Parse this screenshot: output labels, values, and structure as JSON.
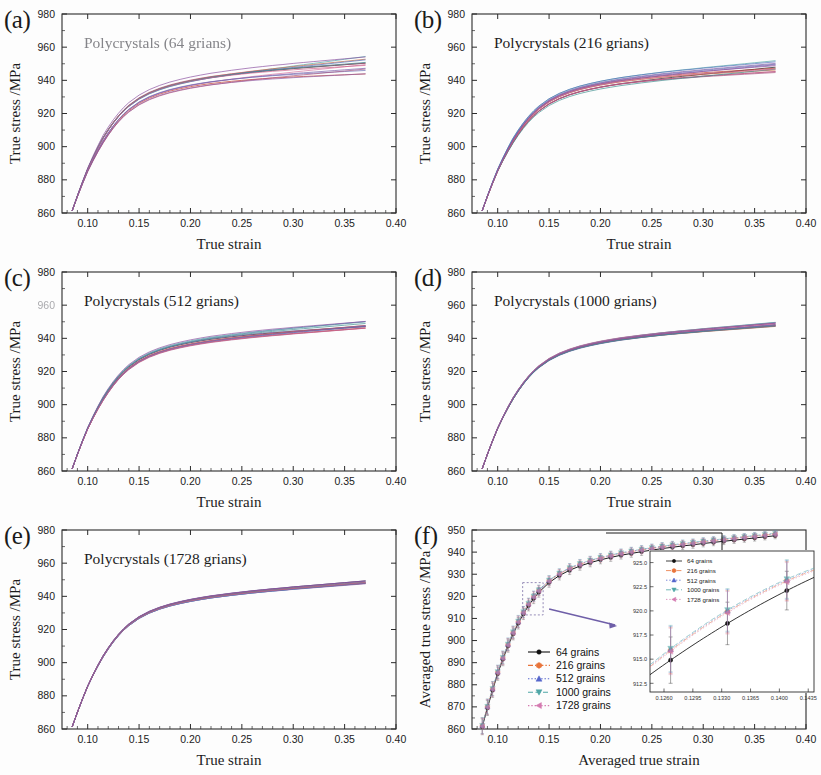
{
  "figure": {
    "background": "#fdfdfd",
    "width": 821,
    "height": 775
  },
  "panels": [
    {
      "id": "a",
      "label": "(a)",
      "title": "Polycrystals (64 grians)",
      "title_degraded": true,
      "xlabel": "True strain",
      "ylabel": "True stress /MPa",
      "xticks": [
        "0.10",
        "0.15",
        "0.20",
        "0.25",
        "0.30",
        "0.35",
        "0.40"
      ],
      "yticks": [
        "860",
        "880",
        "900",
        "920",
        "940",
        "960",
        "980"
      ],
      "xlim": [
        0.075,
        0.4
      ],
      "ylim": [
        860,
        980
      ],
      "spread": 5.2,
      "n_curves": 14
    },
    {
      "id": "b",
      "label": "(b)",
      "title": "Polycrystals (216 grians)",
      "title_degraded": false,
      "xlabel": "True strain",
      "ylabel": "True stress /MPa",
      "xticks": [
        "0.10",
        "0.15",
        "0.20",
        "0.25",
        "0.30",
        "0.35",
        "0.40"
      ],
      "yticks": [
        "860",
        "880",
        "900",
        "920",
        "940",
        "960",
        "980"
      ],
      "xlim": [
        0.075,
        0.4
      ],
      "ylim": [
        860,
        980
      ],
      "spread": 3.4,
      "n_curves": 14
    },
    {
      "id": "c",
      "label": "(c)",
      "title": "Polycrystals (512 grians)",
      "title_degraded": false,
      "xlabel": "True strain",
      "ylabel": "True stress /MPa",
      "xticks": [
        "0.10",
        "0.15",
        "0.20",
        "0.25",
        "0.30",
        "0.35",
        "0.40"
      ],
      "yticks": [
        "860",
        "880",
        "900",
        "920",
        "940",
        "960",
        "980"
      ],
      "xlim": [
        0.075,
        0.4
      ],
      "ylim": [
        860,
        980
      ],
      "spread": 2.1,
      "n_curves": 14
    },
    {
      "id": "d",
      "label": "(d)",
      "title": "Polycrystals (1000 grians)",
      "title_degraded": false,
      "xlabel": "True strain",
      "ylabel": "True stress /MPa",
      "xticks": [
        "0.10",
        "0.15",
        "0.20",
        "0.25",
        "0.30",
        "0.35",
        "0.40"
      ],
      "yticks": [
        "860",
        "880",
        "900",
        "920",
        "940",
        "960",
        "980"
      ],
      "xlim": [
        0.075,
        0.4
      ],
      "ylim": [
        860,
        980
      ],
      "spread": 1.3,
      "n_curves": 14
    },
    {
      "id": "e",
      "label": "(e)",
      "title": "Polycrystals (1728 grians)",
      "title_degraded": false,
      "xlabel": "True strain",
      "ylabel": "True stress /MPa",
      "xticks": [
        "0.10",
        "0.15",
        "0.20",
        "0.25",
        "0.30",
        "0.35",
        "0.40"
      ],
      "yticks": [
        "860",
        "880",
        "900",
        "920",
        "940",
        "960",
        "980"
      ],
      "xlim": [
        0.075,
        0.4
      ],
      "ylim": [
        860,
        980
      ],
      "spread": 0.9,
      "n_curves": 14
    },
    {
      "id": "f",
      "label": "(f)",
      "title": "",
      "title_degraded": false,
      "xlabel": "Averaged true strain",
      "ylabel": "Averaged true stress /MPa",
      "xticks": [
        "0.10",
        "0.15",
        "0.20",
        "0.25",
        "0.30",
        "0.35",
        "0.40"
      ],
      "yticks": [
        "860",
        "870",
        "880",
        "890",
        "900",
        "910",
        "920",
        "930",
        "940",
        "950"
      ],
      "xlim": [
        0.075,
        0.4
      ],
      "ylim": [
        860,
        950
      ]
    }
  ],
  "legend": {
    "entries": [
      {
        "label": "64 grains",
        "color": "#111111",
        "marker": "circle",
        "line": "solid"
      },
      {
        "label": "216 grains",
        "color": "#e8743b",
        "marker": "hexagon",
        "line": "dashdot"
      },
      {
        "label": "512 grains",
        "color": "#5566cc",
        "marker": "triangle-up",
        "line": "dotted"
      },
      {
        "label": "1000 grains",
        "color": "#4fa6a6",
        "marker": "triangle-down",
        "line": "dashed"
      },
      {
        "label": "1728 grains",
        "color": "#d47ab0",
        "marker": "triangle-left",
        "line": "dotted"
      }
    ]
  },
  "inset": {
    "xticks": [
      "0.1260",
      "0.1295",
      "0.1330",
      "0.1365",
      "0.1400",
      "0.1435"
    ],
    "yticks": [
      "912.5",
      "915.0",
      "917.5",
      "920.0",
      "922.5",
      "925.0"
    ],
    "xlim": [
      0.1243,
      0.1442
    ],
    "ylim": [
      911.6,
      926.2
    ],
    "legend_entries": [
      {
        "label": "64 grains",
        "color": "#111111",
        "marker": "circle",
        "line": "solid"
      },
      {
        "label": "216 grains",
        "color": "#e8743b",
        "marker": "hexagon",
        "line": "dashdot"
      },
      {
        "label": "512 grains",
        "color": "#5566cc",
        "marker": "triangle-up",
        "line": "dotted"
      },
      {
        "label": "1000 grains",
        "color": "#4fa6a6",
        "marker": "triangle-down",
        "line": "dashed"
      },
      {
        "label": "1728 grains",
        "color": "#d47ab0",
        "marker": "triangle-left",
        "line": "dotted"
      }
    ],
    "data_points": [
      {
        "x": 0.1268,
        "y_64": 914.9,
        "y_216": 915.9,
        "y_512": 916.0,
        "y_1000": 916.1,
        "y_1728": 915.8,
        "err": 2.4
      },
      {
        "x": 0.1337,
        "y_64": 918.7,
        "y_216": 919.9,
        "y_512": 920.0,
        "y_1000": 920.1,
        "y_1728": 919.8,
        "err": 2.2
      },
      {
        "x": 0.1409,
        "y_64": 922.1,
        "y_216": 923.1,
        "y_512": 923.2,
        "y_1000": 923.3,
        "y_1728": 923.0,
        "err": 2.0
      }
    ]
  },
  "annotation": {
    "zoom_box_color": "#8a7fb0",
    "arrow_color": "#6f5fa8",
    "bracket_color": "#1a1a1a"
  },
  "chart_data": {
    "type": "line",
    "xlabel": "True strain",
    "ylabel": "True stress /MPa",
    "xlim": [
      0.075,
      0.4
    ],
    "ylim": [
      860,
      980
    ],
    "grid": false,
    "legend_position": "center-left (panel f)",
    "note": "Panels (a)-(e) each show ~14 overlapping stress-strain curves for random grain orientation sets; scatter narrows as grain count increases. Panel (f) overlays the averaged curves with standard-deviation error bars for all five grain counts, with an inset magnifying strain 0.126-0.144.",
    "x": [
      0.085,
      0.09,
      0.095,
      0.1,
      0.105,
      0.11,
      0.115,
      0.12,
      0.125,
      0.13,
      0.135,
      0.14,
      0.15,
      0.16,
      0.17,
      0.18,
      0.19,
      0.2,
      0.21,
      0.22,
      0.23,
      0.24,
      0.25,
      0.26,
      0.27,
      0.28,
      0.29,
      0.3,
      0.31,
      0.32,
      0.33,
      0.34,
      0.35,
      0.36,
      0.37
    ],
    "series": [
      {
        "name": "64 grains",
        "color": "#111111",
        "values": [
          861.0,
          869.5,
          877.5,
          885.0,
          891.5,
          897.5,
          903.0,
          907.8,
          912.0,
          915.8,
          919.0,
          921.8,
          926.2,
          929.4,
          931.8,
          933.7,
          935.2,
          936.5,
          937.6,
          938.6,
          939.4,
          940.2,
          940.9,
          941.6,
          942.2,
          942.8,
          943.3,
          943.9,
          944.4,
          944.9,
          945.4,
          945.9,
          946.4,
          946.9,
          947.4
        ]
      },
      {
        "name": "216 grains",
        "color": "#e8743b",
        "values": [
          861.4,
          870.0,
          878.1,
          885.6,
          892.1,
          898.1,
          903.6,
          908.5,
          912.7,
          916.5,
          919.8,
          922.6,
          927.0,
          930.2,
          932.6,
          934.5,
          936.0,
          937.3,
          938.4,
          939.4,
          940.2,
          941.0,
          941.7,
          942.4,
          943.0,
          943.6,
          944.1,
          944.7,
          945.2,
          945.7,
          946.2,
          946.7,
          947.2,
          947.7,
          948.2
        ]
      },
      {
        "name": "512 grains",
        "color": "#5566cc",
        "values": [
          861.5,
          870.1,
          878.2,
          885.8,
          892.3,
          898.3,
          903.8,
          908.6,
          912.9,
          916.7,
          920.0,
          922.8,
          927.2,
          930.4,
          932.8,
          934.7,
          936.2,
          937.5,
          938.6,
          939.6,
          940.4,
          941.2,
          941.9,
          942.6,
          943.2,
          943.8,
          944.3,
          944.9,
          945.4,
          945.9,
          946.4,
          946.9,
          947.4,
          947.9,
          948.4
        ]
      },
      {
        "name": "1000 grains",
        "color": "#4fa6a6",
        "values": [
          861.6,
          870.2,
          878.3,
          885.9,
          892.4,
          898.4,
          903.9,
          908.8,
          913.0,
          916.8,
          920.1,
          922.9,
          927.3,
          930.5,
          932.9,
          934.8,
          936.3,
          937.6,
          938.7,
          939.7,
          940.5,
          941.3,
          942.0,
          942.7,
          943.3,
          943.9,
          944.4,
          945.0,
          945.5,
          946.0,
          946.5,
          947.0,
          947.5,
          948.0,
          948.5
        ]
      },
      {
        "name": "1728 grains",
        "color": "#d47ab0",
        "values": [
          861.3,
          869.9,
          878.0,
          885.5,
          892.0,
          898.0,
          903.5,
          908.4,
          912.6,
          916.4,
          919.7,
          922.5,
          926.9,
          930.1,
          932.5,
          934.4,
          935.9,
          937.2,
          938.3,
          939.3,
          940.1,
          940.9,
          941.6,
          942.3,
          942.9,
          943.5,
          944.0,
          944.6,
          945.1,
          945.6,
          946.1,
          946.6,
          947.1,
          947.6,
          948.1
        ]
      }
    ],
    "error_bars_panel_f": [
      3.6,
      3.4,
      3.2,
      3.0,
      2.9,
      2.8,
      2.7,
      2.6,
      2.5,
      2.4,
      2.3,
      2.2,
      2.1,
      2.0,
      1.95,
      1.9,
      1.85,
      1.8,
      1.78,
      1.75,
      1.72,
      1.7,
      1.68,
      1.65,
      1.62,
      1.6,
      1.58,
      1.55,
      1.52,
      1.5,
      1.48,
      1.45,
      1.42,
      1.4,
      1.38
    ]
  }
}
